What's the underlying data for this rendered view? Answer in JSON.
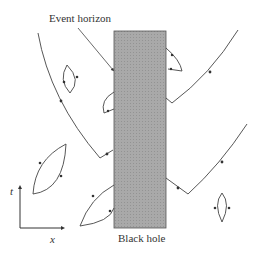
{
  "labels": {
    "event_horizon": "Event horizon",
    "black_hole": "Black hole",
    "time_axis": "t",
    "space_axis": "x"
  },
  "colors": {
    "black_hole_fill": "#a8a8a8",
    "line": "#444444"
  }
}
